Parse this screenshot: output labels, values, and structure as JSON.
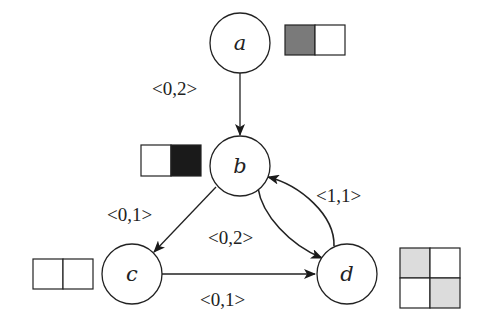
{
  "colors": {
    "stroke": "#222222",
    "dark_gray": "#7a7a7a",
    "black": "#1a1a1a",
    "light_gray": "#dcdcdc",
    "white": "#ffffff"
  },
  "nodes": [
    {
      "id": "a",
      "label": "a"
    },
    {
      "id": "b",
      "label": "b"
    },
    {
      "id": "c",
      "label": "c"
    },
    {
      "id": "d",
      "label": "d"
    }
  ],
  "edges": [
    {
      "from": "a",
      "to": "b",
      "label": "<0,2>"
    },
    {
      "from": "b",
      "to": "c",
      "label": "<0,1>"
    },
    {
      "from": "b",
      "to": "d",
      "label": "<0,2>"
    },
    {
      "from": "d",
      "to": "b",
      "label": "<1,1>"
    },
    {
      "from": "c",
      "to": "d",
      "label": "<0,1>"
    }
  ],
  "state_boxes": [
    {
      "node": "a",
      "cells": [
        "dark-gray",
        "white"
      ]
    },
    {
      "node": "b",
      "cells": [
        "white",
        "black"
      ]
    },
    {
      "node": "c",
      "cells": [
        "white",
        "white"
      ]
    },
    {
      "node": "d",
      "cells": [
        "light-gray",
        "white",
        "white",
        "light-gray"
      ]
    }
  ]
}
